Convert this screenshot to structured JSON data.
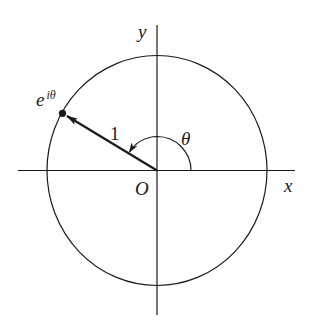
{
  "diagram": {
    "type": "unit-circle-complex-plane",
    "labels": {
      "y_axis": "y",
      "x_axis": "x",
      "origin": "O",
      "radius": "1",
      "angle": "θ",
      "point_base": "e",
      "point_exponent": "iθ"
    },
    "geometry": {
      "origin": [
        157,
        170.5
      ],
      "radius_px": 110,
      "angle_deg": 149,
      "point": [
        62.7,
        113.3
      ]
    },
    "colors": {
      "stroke": "#1a1a1a",
      "background": "#ffffff"
    }
  }
}
